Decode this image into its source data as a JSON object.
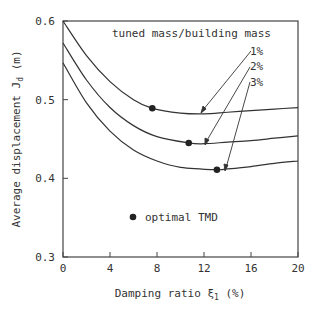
{
  "chart_data": {
    "type": "line",
    "title": "",
    "xlabel": "Damping ratio ξ1 (%)",
    "ylabel": "Average displacement Jd (m)",
    "xlim": [
      0,
      20
    ],
    "ylim": [
      0.3,
      0.6
    ],
    "xticks": [
      "0",
      "4",
      "8",
      "12",
      "16",
      "20"
    ],
    "yticks": [
      "0.3",
      "0.4",
      "0.5",
      "0.6"
    ],
    "grid": false,
    "legend_title": "tuned mass/building mass",
    "series": [
      {
        "name": "1%",
        "x": [
          0,
          2,
          4,
          6,
          7.6,
          10,
          12,
          14,
          16,
          18,
          20
        ],
        "values": [
          0.6,
          0.556,
          0.523,
          0.5,
          0.489,
          0.483,
          0.482,
          0.484,
          0.486,
          0.488,
          0.49
        ]
      },
      {
        "name": "2%",
        "x": [
          0,
          2,
          4,
          6,
          8,
          10.7,
          12,
          14,
          16,
          18,
          20
        ],
        "values": [
          0.572,
          0.525,
          0.49,
          0.467,
          0.453,
          0.445,
          0.444,
          0.446,
          0.448,
          0.451,
          0.454
        ]
      },
      {
        "name": "3%",
        "x": [
          0,
          2,
          4,
          6,
          8,
          10,
          13.1,
          14,
          16,
          18,
          20
        ],
        "values": [
          0.547,
          0.496,
          0.46,
          0.436,
          0.422,
          0.414,
          0.411,
          0.412,
          0.415,
          0.419,
          0.422
        ]
      }
    ],
    "optimal_points": [
      {
        "series": "1%",
        "x": 7.6,
        "y": 0.489
      },
      {
        "series": "2%",
        "x": 10.7,
        "y": 0.445
      },
      {
        "series": "3%",
        "x": 13.1,
        "y": 0.411
      }
    ],
    "annotations": [
      "tuned mass/building mass",
      "1%",
      "2%",
      "3%",
      "optimal TMD"
    ]
  },
  "labels": {
    "legend_title": "tuned mass/building mass",
    "s1": "1%",
    "s2": "2%",
    "s3": "3%",
    "marker_legend": "optimal TMD",
    "xlabel_pre": "Damping ratio ",
    "xlabel_sym": "ξ",
    "xlabel_sub": "1",
    "xlabel_post": " (%)",
    "ylabel_pre": "Average displacement ",
    "ylabel_sym": "J",
    "ylabel_sub": "d",
    "ylabel_post": " (m)"
  }
}
